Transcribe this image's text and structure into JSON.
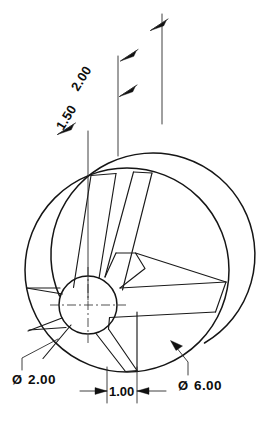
{
  "drawing": {
    "title": "Spoked Hub Pictorial Drawing",
    "type": "engineering-pictorial-drawing",
    "background_color": "#ffffff",
    "line_color": "#151515",
    "dimensions": [
      {
        "id": "depth-2-00",
        "label": "2.00",
        "orientation": "slanted",
        "rotation_deg": -58,
        "text_x": 78,
        "text_y": 92,
        "describes": "overall depth to rear face"
      },
      {
        "id": "depth-1-50",
        "label": "1.50",
        "orientation": "slanted",
        "rotation_deg": -58,
        "text_x": 63,
        "text_y": 131,
        "describes": "depth to intermediate face"
      },
      {
        "id": "hub-bore-diameter",
        "label": "2.00",
        "symbol": "Ø",
        "orientation": "horizontal",
        "text_x": 12,
        "text_y": 384,
        "describes": "hub bore diameter with leader"
      },
      {
        "id": "web-thickness",
        "label": "1.00",
        "orientation": "horizontal",
        "text_x": 110,
        "text_y": 396,
        "describes": "spoke / web thickness between extension lines"
      },
      {
        "id": "outer-diameter",
        "label": "6.00",
        "symbol": "Ø",
        "orientation": "horizontal",
        "text_x": 178,
        "text_y": 390,
        "describes": "outer wheel diameter with leader"
      }
    ],
    "features": {
      "outer_circle_front": {
        "cx": 127,
        "cy": 270,
        "r": 102
      },
      "outer_circle_rear": {
        "cx": 160,
        "cy": 233,
        "r": 102
      },
      "hub_circle": {
        "cx": 88,
        "cy": 305,
        "r": 29
      },
      "spoke_count": 4,
      "centerline_marks": "crosshair at hub center"
    }
  }
}
